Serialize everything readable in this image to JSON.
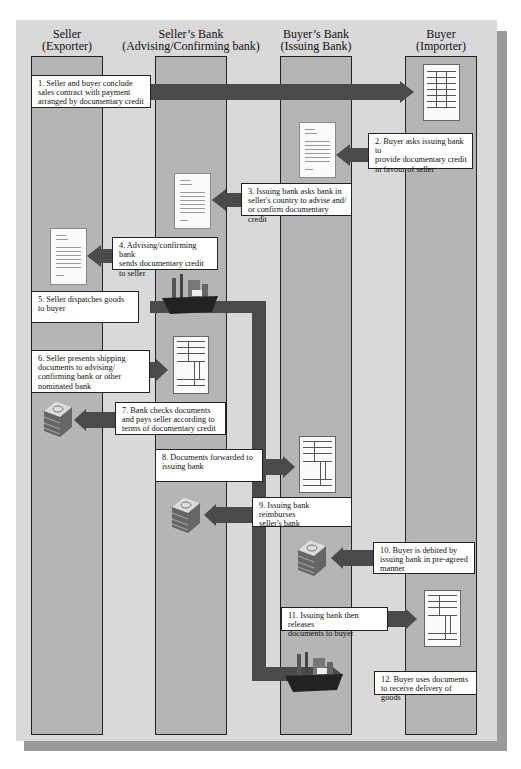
{
  "columns": [
    {
      "title": "Seller",
      "subtitle": "(Exporter)"
    },
    {
      "title": "Seller’s Bank",
      "subtitle": "(Advising/Confirming bank)"
    },
    {
      "title": "Buyer’s Bank",
      "subtitle": "(Issuing Bank)"
    },
    {
      "title": "Buyer",
      "subtitle": "(Importer)"
    }
  ],
  "steps": [
    {
      "text": "1. Seller and buyer conclude\n    sales contract with payment\n    arranged by documentary credit",
      "icon": "contract-document-icon"
    },
    {
      "text": "2. Buyer asks issuing bank to\n    provide documentary credit\n    in favour of seller",
      "icon": "letter-document-icon"
    },
    {
      "text": "3. Issuing bank asks bank in\n    seller's country to advise and/\n    or confirm documentary credit",
      "icon": "letter-document-icon"
    },
    {
      "text": "4. Advising/confirming bank\n    sends documentary credit\n    to  seller",
      "icon": "letter-document-icon"
    },
    {
      "text": "5. Seller dispatches goods\n    to buyer",
      "icon": "cargo-ship-icon"
    },
    {
      "text": "6. Seller presents shipping\n    documents to advising/\n    confirming bank or other\n    nominated bank",
      "icon": "shipping-documents-icon"
    },
    {
      "text": "7. Bank checks documents\n    and pays seller according to\n    terms of documentary credit",
      "icon": "money-stack-icon"
    },
    {
      "text": "8. Documents forwarded to\n    issuing bank",
      "icon": "shipping-documents-icon"
    },
    {
      "text": "9. Issuing bank reimburses\n    seller's bank",
      "icon": "money-stack-icon"
    },
    {
      "text": "10. Buyer is debited by\n      issuing bank in pre-agreed\n      manner",
      "icon": "money-stack-icon"
    },
    {
      "text": "11. Issuing bank then releases\n      documents to buyer",
      "icon": "shipping-documents-icon"
    },
    {
      "text": "12. Buyer uses documents\n      to receive delivery of goods",
      "icon": "cargo-ship-icon"
    }
  ],
  "colors": {
    "panel": "#d9d9d9",
    "lane": "#b5b5b5",
    "arrow": "#4a4a4a",
    "shadow": "#9a9a9a"
  }
}
